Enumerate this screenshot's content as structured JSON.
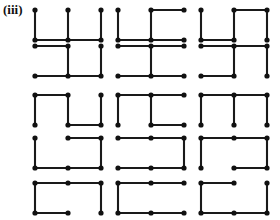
{
  "figure": {
    "label": "(iii)",
    "ink_color": "#111111",
    "background_color": "#ffffff",
    "node_radius": 2.6,
    "edge_width": 2.1
  },
  "layout": {
    "rows": 5,
    "cols": 3,
    "cell_origins_x": [
      35,
      118,
      201
    ],
    "cell_origins_y": [
      10,
      46,
      95,
      138,
      183
    ],
    "node_dx": 33,
    "node_dy": 30,
    "nodes_per_cell_cols": 3,
    "nodes_per_cell_rows": 2
  },
  "cells": [
    {
      "id": "r1c1",
      "row": 1,
      "col": 1,
      "edges": {
        "top": [
          false,
          false
        ],
        "bottom": [
          true,
          true
        ],
        "vertical": [
          true,
          true,
          true
        ]
      }
    },
    {
      "id": "r1c2",
      "row": 1,
      "col": 2,
      "edges": {
        "top": [
          false,
          true
        ],
        "bottom": [
          true,
          true
        ],
        "vertical": [
          true,
          true,
          false
        ]
      }
    },
    {
      "id": "r1c3",
      "row": 1,
      "col": 3,
      "edges": {
        "top": [
          false,
          true
        ],
        "bottom": [
          true,
          false
        ],
        "vertical": [
          true,
          true,
          true
        ]
      }
    },
    {
      "id": "r2c1",
      "row": 2,
      "col": 1,
      "edges": {
        "top": [
          true,
          false
        ],
        "bottom": [
          true,
          true
        ],
        "vertical": [
          false,
          true,
          true
        ]
      }
    },
    {
      "id": "r2c2",
      "row": 2,
      "col": 2,
      "edges": {
        "top": [
          true,
          true
        ],
        "bottom": [
          true,
          true
        ],
        "vertical": [
          false,
          true,
          false
        ]
      }
    },
    {
      "id": "r2c3",
      "row": 2,
      "col": 3,
      "edges": {
        "top": [
          true,
          true
        ],
        "bottom": [
          true,
          false
        ],
        "vertical": [
          false,
          true,
          true
        ]
      }
    },
    {
      "id": "r3c1",
      "row": 3,
      "col": 1,
      "edges": {
        "top": [
          true,
          false
        ],
        "bottom": [
          false,
          true
        ],
        "vertical": [
          true,
          true,
          true
        ]
      }
    },
    {
      "id": "r3c2",
      "row": 3,
      "col": 2,
      "edges": {
        "top": [
          true,
          true
        ],
        "bottom": [
          false,
          true
        ],
        "vertical": [
          true,
          true,
          false
        ]
      }
    },
    {
      "id": "r3c3",
      "row": 3,
      "col": 3,
      "edges": {
        "top": [
          true,
          true
        ],
        "bottom": [
          false,
          false
        ],
        "vertical": [
          true,
          true,
          true
        ]
      }
    },
    {
      "id": "r4c1",
      "row": 4,
      "col": 1,
      "edges": {
        "top": [
          false,
          true
        ],
        "bottom": [
          true,
          true
        ],
        "vertical": [
          true,
          false,
          true
        ]
      }
    },
    {
      "id": "r4c2",
      "row": 4,
      "col": 2,
      "edges": {
        "top": [
          true,
          true
        ],
        "bottom": [
          true,
          true
        ],
        "vertical": [
          false,
          false,
          true
        ]
      }
    },
    {
      "id": "r4c3",
      "row": 4,
      "col": 3,
      "edges": {
        "top": [
          true,
          true
        ],
        "bottom": [
          false,
          true
        ],
        "vertical": [
          true,
          false,
          true
        ]
      }
    },
    {
      "id": "r5c1",
      "row": 5,
      "col": 1,
      "edges": {
        "top": [
          true,
          true
        ],
        "bottom": [
          true,
          false
        ],
        "vertical": [
          true,
          false,
          true
        ]
      }
    },
    {
      "id": "r5c2",
      "row": 5,
      "col": 2,
      "edges": {
        "top": [
          true,
          true
        ],
        "bottom": [
          true,
          true
        ],
        "vertical": [
          true,
          false,
          false
        ]
      }
    },
    {
      "id": "r5c3",
      "row": 5,
      "col": 3,
      "edges": {
        "top": [
          true,
          false
        ],
        "bottom": [
          true,
          true
        ],
        "vertical": [
          true,
          false,
          true
        ]
      }
    }
  ]
}
